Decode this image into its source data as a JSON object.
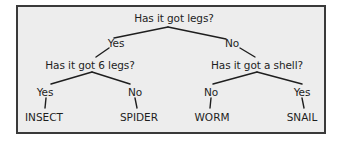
{
  "diagram": {
    "type": "decision-tree",
    "colors": {
      "background": "#ffffff",
      "panel": "#ededed",
      "border": "#3a3a3a",
      "line": "#1e1e1e",
      "text": "#1e1e1e"
    },
    "root": {
      "question": "Has it got legs?",
      "yes_label": "Yes",
      "no_label": "No"
    },
    "left_node": {
      "question": "Has it got 6 legs?",
      "yes_label": "Yes",
      "no_label": "No",
      "yes_result": "INSECT",
      "no_result": "SPIDER"
    },
    "right_node": {
      "question": "Has it got a shell?",
      "no_label": "No",
      "yes_label": "Yes",
      "no_result": "WORM",
      "yes_result": "SNAIL"
    }
  }
}
